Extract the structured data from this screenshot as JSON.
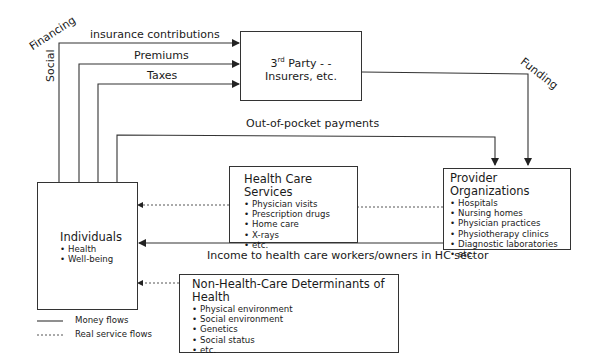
{
  "side_labels": {
    "financing": "Financing",
    "social": "Social",
    "funding": "Funding"
  },
  "flows": {
    "insurance_contributions": "insurance contributions",
    "premiums": "Premiums",
    "taxes": "Taxes",
    "out_of_pocket": "Out-of-pocket payments",
    "income": "Income to health care workers/owners in HC sector"
  },
  "third_party": {
    "line1_main": "3",
    "line1_sup": "rd",
    "line1_rest": " Party - -",
    "line2": "Insurers, etc."
  },
  "individuals": {
    "title": "Individuals",
    "items": [
      "Health",
      "Well-being"
    ]
  },
  "health_care_services": {
    "title": "Health Care Services",
    "items": [
      "Physician visits",
      "Prescription drugs",
      "Home care",
      "X-rays",
      "etc."
    ]
  },
  "provider_organizations": {
    "title": "Provider Organizations",
    "items": [
      "Hospitals",
      "Nursing homes",
      "Physician practices",
      "Physiotherapy clinics",
      "Diagnostic laboratories",
      "etc."
    ]
  },
  "non_hc_determinants": {
    "title": "Non-Health-Care Determinants of Health",
    "items": [
      "Physical environment",
      "Social environment",
      "Genetics",
      "Social status",
      "etc."
    ]
  },
  "legend": {
    "money": "Money flows",
    "real": "Real service flows"
  },
  "colors": {
    "line": "#333333",
    "dashed": "#555555"
  }
}
